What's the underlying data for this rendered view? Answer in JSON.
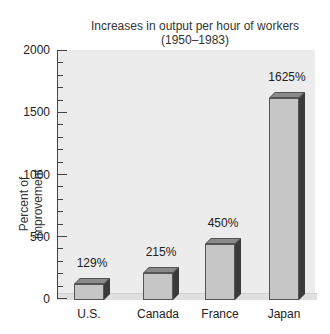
{
  "chart_data": {
    "type": "bar",
    "title": "Increases in output per hour of workers",
    "subtitle": "(1950–1983)",
    "xlabel": "",
    "ylabel": "Percent of improvement",
    "categories": [
      "U.S.",
      "Canada",
      "France",
      "Japan"
    ],
    "values": [
      129,
      215,
      450,
      1625
    ],
    "value_labels": [
      "129%",
      "215%",
      "450%",
      "1625%"
    ],
    "ylim": [
      0,
      2000
    ],
    "yticks": [
      0,
      500,
      1000,
      1500,
      2000
    ],
    "ytick_labels": [
      "0",
      "500",
      "1000",
      "1500",
      "2000"
    ],
    "minor_tick_step": 100,
    "grid": false,
    "legend": null,
    "style": "3d-bar"
  },
  "colors": {
    "bar_front": "#c6c6c6",
    "bar_top": "#8a8a8a",
    "bar_side": "#3a3a3a",
    "panel": "#ececec"
  }
}
